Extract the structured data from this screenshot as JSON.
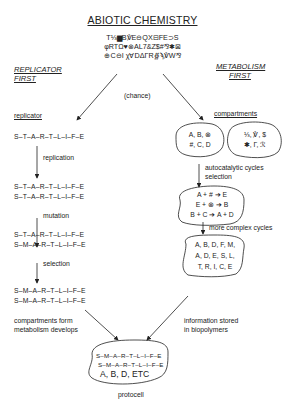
{
  "title": "ABIOTIC CHEMISTRY",
  "symbols": [
    "T⅓▆B℣E⊖QX⊟FE⊃S",
    "φRTΩ♥⊗AL7&Z$#⅋✱⊠",
    "⊕C⊖I χ∀DΔΓR∯ϡ℣W⅋"
  ],
  "left_heading": [
    "REPLICATOR",
    "FIRST"
  ],
  "right_heading": [
    "METABOLISM",
    "FIRST"
  ],
  "chance_label": "(chance)",
  "replicator_path": {
    "label": "replicator",
    "seq0": "S–T–A–R–T–L–I–F–E",
    "step1": "replication",
    "seq1": [
      "S–T–A–R–T–L–I–F–E",
      "S–T–A–R–T–L–I–F–E"
    ],
    "step2": "mutation",
    "seq2": [
      "S–T–A–R–T–L–I–F–E",
      "S–M–A–R–T–L–I–F–E"
    ],
    "step3": "selection",
    "seq3": [
      "S–M–A–R–T–L–I–F–E",
      "S–M–A–R–T–L–I–F–E"
    ],
    "final_step": [
      "compartments form",
      "metabolism develops"
    ]
  },
  "metabolism_path": {
    "label": "compartments",
    "compartment_a": [
      "A, B, ⊗",
      "#, C, D"
    ],
    "compartment_b": [
      "⅓, ℣, $",
      "✱, Γ, ℛ"
    ],
    "step1": [
      "autocatalytic cycles",
      "selection"
    ],
    "reactions": [
      "A + # ➔ E",
      "E + ⊗ ➔ B",
      "B + C ➔ A + D"
    ],
    "step2": "more complex cycles",
    "complex": [
      "A, B, D, F, M,",
      "A, D, E, S, L,",
      "T, R, I, C, E"
    ],
    "final_step": [
      "information stored",
      "in biopolymers"
    ]
  },
  "protocell": {
    "seqs": [
      "S–M–A–R–T–L–I–F–E",
      "S–M–A–R–T–L–I–F–E"
    ],
    "contents": "A, B, D, ETC",
    "label": "protocell"
  }
}
